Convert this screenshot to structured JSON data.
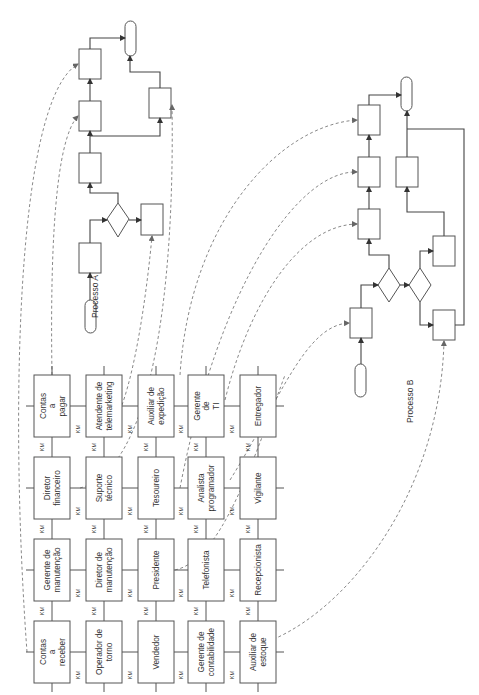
{
  "processes": {
    "a": {
      "label": "Processo A"
    },
    "b": {
      "label": "Processo B"
    }
  },
  "connector_label": "KM",
  "grid": {
    "rows": [
      [
        "Contas|a|pagar",
        "Atendente de|telemarketing",
        "Auxiliar de|expedição",
        "Gerente|de|TI",
        "Entregador"
      ],
      [
        "Diretor|financeiro",
        "Suporte|técnico",
        "Tesoureiro",
        "Analista|programador",
        "Vigilante"
      ],
      [
        "Gerente de|manutenção",
        "Diretor de|manutenção",
        "Presidente",
        "Telefonista",
        "Recepcionista"
      ],
      [
        "Contas|a|receber",
        "Operador de|torno",
        "Vendedor",
        "Gerente de|contabilidade",
        "Auxiliar de|estoque"
      ]
    ]
  },
  "colors": {
    "stroke": "#555555",
    "dashed": "#7a7a7a",
    "text": "#333333"
  }
}
